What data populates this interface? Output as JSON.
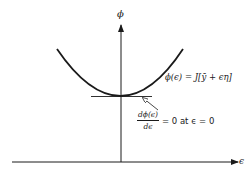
{
  "figure": {
    "type": "diagram",
    "axes": {
      "y_label": "ϕ",
      "x_label": "ϵ"
    },
    "curve": {
      "shape": "parabola",
      "label": "ϕ(ϵ) = J[ȳ + ϵη]",
      "minimum_at": "ϵ = 0"
    },
    "tangent": {
      "orientation": "horizontal",
      "annotation": {
        "numerator": "dϕ(ϵ)",
        "denominator": "dϵ",
        "rest": "= 0 at ϵ = 0"
      }
    }
  }
}
